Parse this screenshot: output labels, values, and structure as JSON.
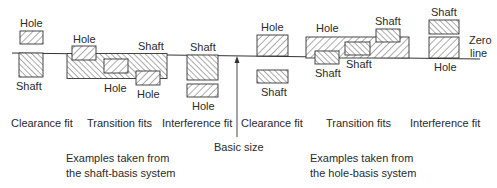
{
  "diagram": {
    "zero_line_label": [
      "Zero",
      "line"
    ],
    "basic_size_label": "Basic size",
    "colors": {
      "line": "#333333",
      "text": "#2a2a2a",
      "background": "#ffffff"
    },
    "shaft_basis": {
      "caption": [
        "Examples taken from",
        "the shaft-basis system"
      ],
      "clearance": {
        "title": "Clearance fit",
        "hole_label": "Hole",
        "shaft_label": "Shaft"
      },
      "transition": {
        "title": "Transition fits",
        "shaft_label": "Shaft",
        "hole_labels": [
          "Hole",
          "Hole",
          "Hole"
        ]
      },
      "interference": {
        "title": "Interference fit",
        "shaft_label": "Shaft",
        "hole_label": "Hole"
      }
    },
    "hole_basis": {
      "caption": [
        "Examples taken from",
        "the hole-basis system"
      ],
      "clearance": {
        "title": "Clearance fit",
        "hole_label": "Hole",
        "shaft_label": "Shaft"
      },
      "transition": {
        "title": "Transition fits",
        "hole_label": "Hole",
        "shaft_labels": [
          "Shaft",
          "Shaft",
          "Shaft"
        ]
      },
      "interference": {
        "title": "Interference fit",
        "shaft_label": "Shaft",
        "hole_label": "Hole"
      }
    }
  }
}
